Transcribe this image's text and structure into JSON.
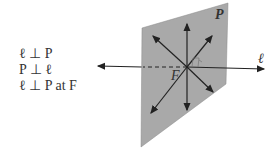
{
  "statements": [
    "ℓ ⊥ P",
    "P ⊥ ℓ",
    "ℓ ⊥ P at F"
  ],
  "labels": {
    "plane": "P",
    "line": "ℓ",
    "foot": "F"
  },
  "colors": {
    "plane": "#a9a9a9",
    "stroke": "#222222"
  }
}
